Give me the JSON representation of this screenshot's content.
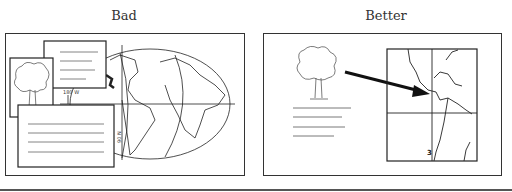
{
  "panels": [
    {
      "title": "Bad",
      "map_labels": {
        "longitude": "180 W",
        "latitude": "90 N"
      }
    },
    {
      "title": "Better",
      "map_labels": {
        "marker": "3"
      }
    }
  ],
  "colors": {
    "line": "#222222",
    "text": "#333333",
    "background": "#ffffff"
  }
}
